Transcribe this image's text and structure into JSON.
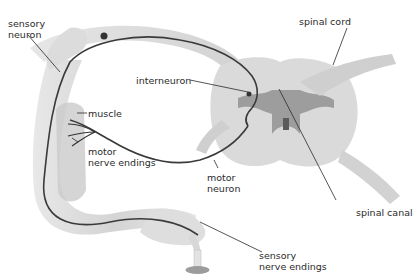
{
  "diagram": {
    "labels": {
      "sensory_neuron": [
        "sensory",
        "neuron"
      ],
      "spinal_cord": "spinal cord",
      "interneuron": "interneuron",
      "muscle": "muscle",
      "motor_nerve_endings": [
        "motor",
        "nerve endings"
      ],
      "motor_neuron": [
        "motor",
        "neuron"
      ],
      "spinal_canal": "spinal canal",
      "sensory_nerve_endings": [
        "sensory",
        "nerve endings"
      ]
    },
    "colors": {
      "tissue_light": "#e4e4e4",
      "tissue_mid": "#cfcfcf",
      "tissue_dark": "#a8a8a8",
      "grey_matter": "#8f8f8f",
      "nerve": "#3a3a3a",
      "leader_line": "#2a2a2a"
    }
  }
}
